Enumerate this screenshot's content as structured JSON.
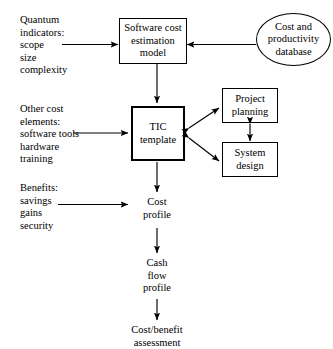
{
  "diagram": {
    "colors": {
      "stroke": "#000000",
      "background": "#ffffff",
      "text": "#000000"
    },
    "inputs": [
      {
        "id": "quantum-indicators",
        "text": "Quantum\nindicators:\nscope\nsize\ncomplexity"
      },
      {
        "id": "other-cost-elements",
        "text": "Other cost\nelements:\nsoftware tools\nhardware\ntraining"
      },
      {
        "id": "benefits",
        "text": "Benefits:\nsavings\ngains\nsecurity"
      }
    ],
    "nodes": [
      {
        "id": "software-cost-estimation-model",
        "shape": "rect",
        "text": "Software cost\nestimation\nmodel"
      },
      {
        "id": "cost-and-productivity-database",
        "shape": "ellipse",
        "text": "Cost and\nproductivity\ndatabase"
      },
      {
        "id": "tic-template",
        "shape": "rect-thick",
        "text": "TIC\ntemplate"
      },
      {
        "id": "project-planning",
        "shape": "rect",
        "text": "Project\nplanning"
      },
      {
        "id": "system-design",
        "shape": "rect",
        "text": "System\ndesign"
      }
    ],
    "outputs": [
      {
        "id": "cost-profile",
        "text": "Cost\nprofile"
      },
      {
        "id": "cash-flow-profile",
        "text": "Cash\nflow\nprofile"
      },
      {
        "id": "cost-benefit-assessment",
        "text": "Cost/benefit\nassessment"
      }
    ]
  }
}
